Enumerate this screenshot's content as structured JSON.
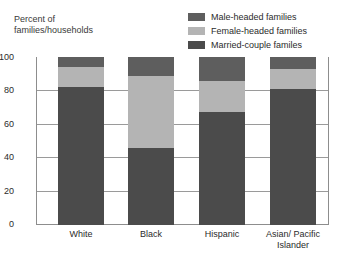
{
  "chart_data": {
    "type": "bar",
    "subtype": "stacked-bar",
    "title": "",
    "xlabel": "",
    "ylabel": "Percent of\nfamilies/households",
    "ylim": [
      0,
      100
    ],
    "yticks": [
      0,
      20,
      40,
      60,
      80,
      100
    ],
    "ytick_labels": [
      "0",
      "20",
      "40",
      "60",
      "80",
      "100"
    ],
    "grid": true,
    "grid_axis": "y",
    "legend_position": "top-right",
    "stack_order_bottom_to_top": [
      "Married-couple familes",
      "Female-headed families",
      "Male-headed families"
    ],
    "categories": [
      "White",
      "Black",
      "Hispanic",
      "Asian/Pacific Islander"
    ],
    "series": [
      {
        "name": "Married-couple familes",
        "color": "#4b4b4b",
        "values": [
          82,
          46,
          67,
          81
        ]
      },
      {
        "name": "Female-headed families",
        "color": "#b4b4b4",
        "values": [
          12,
          43,
          19,
          12
        ]
      },
      {
        "name": "Male-headed families",
        "color": "#5e5e5e",
        "values": [
          6,
          11,
          14,
          7
        ]
      }
    ],
    "annotations": []
  },
  "axis": {
    "y_caption": "Percent of\nfamilies/households",
    "ticks": [
      {
        "label": "100",
        "value": 100
      },
      {
        "label": "80",
        "value": 80
      },
      {
        "label": "60",
        "value": 60
      },
      {
        "label": "40",
        "value": 40
      },
      {
        "label": "20",
        "value": 20
      },
      {
        "label": "0",
        "value": 0
      }
    ]
  },
  "legend": {
    "items": [
      {
        "label": "Male-headed families",
        "color": "#5e5e5e"
      },
      {
        "label": "Female-headed families",
        "color": "#b4b4b4"
      },
      {
        "label": "Married-couple familes",
        "color": "#4b4b4b"
      }
    ]
  },
  "x_axis": {
    "labels": [
      "White",
      "Black",
      "Hispanic",
      "Asian/ Pacific\nIslander"
    ]
  },
  "colors": {
    "frame": "#8d8d8d",
    "gridline": "#9a9a9a",
    "background": "#ffffff",
    "text": "#2b2b2b"
  }
}
